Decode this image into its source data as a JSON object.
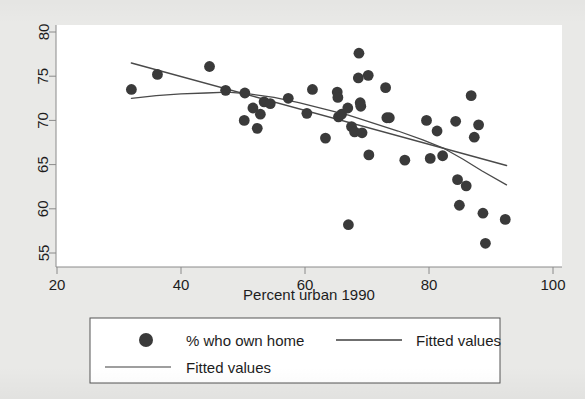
{
  "figure": {
    "background_color": "#e9e9e7",
    "plot_area_color": "#ffffff",
    "frame_color": "#8a8a8a",
    "marker_color": "#3a3a3a",
    "line_color": "#4a4a4a",
    "text_color": "#1d1d1d"
  },
  "axis": {
    "x_title": "Percent urban 1990",
    "x_ticks": [
      "20",
      "40",
      "60",
      "80",
      "100"
    ],
    "y_ticks": [
      "55",
      "60",
      "65",
      "70",
      "75",
      "80"
    ]
  },
  "legend": {
    "entries": [
      {
        "label": "% who own home",
        "marker": "dot"
      },
      {
        "label": "Fitted values",
        "marker": "line"
      },
      {
        "label": "Fitted values",
        "marker": "line"
      }
    ]
  },
  "chart_data": {
    "type": "scatter",
    "title": "",
    "subtitle": "",
    "xlabel": "Percent urban 1990",
    "ylabel": "",
    "xlim": [
      20,
      100
    ],
    "ylim": [
      54.0,
      80.8
    ],
    "xticks": [
      20,
      40,
      60,
      80,
      100
    ],
    "yticks": [
      55,
      60,
      65,
      70,
      75,
      80
    ],
    "grid": false,
    "legend_position": "below-plot",
    "series": [
      {
        "name": "% who own home",
        "type": "scatter",
        "marker": "filled-circle",
        "color": "#3a3a3a",
        "points": [
          [
            32.0,
            73.5
          ],
          [
            36.2,
            75.2
          ],
          [
            44.6,
            76.1
          ],
          [
            47.2,
            73.4
          ],
          [
            50.3,
            73.1
          ],
          [
            50.2,
            70.0
          ],
          [
            51.6,
            71.4
          ],
          [
            52.3,
            69.1
          ],
          [
            52.8,
            70.7
          ],
          [
            53.4,
            72.1
          ],
          [
            54.4,
            71.9
          ],
          [
            57.3,
            72.5
          ],
          [
            60.3,
            70.8
          ],
          [
            61.2,
            73.5
          ],
          [
            63.3,
            68.0
          ],
          [
            65.2,
            73.2
          ],
          [
            65.3,
            72.6
          ],
          [
            65.4,
            70.4
          ],
          [
            65.9,
            70.7
          ],
          [
            66.9,
            71.4
          ],
          [
            67.0,
            58.2
          ],
          [
            67.5,
            69.3
          ],
          [
            68.0,
            68.7
          ],
          [
            68.6,
            74.8
          ],
          [
            68.7,
            77.6
          ],
          [
            68.9,
            72.0
          ],
          [
            69.0,
            71.6
          ],
          [
            69.2,
            68.6
          ],
          [
            70.2,
            75.1
          ],
          [
            70.3,
            66.1
          ],
          [
            73.0,
            73.7
          ],
          [
            73.2,
            70.3
          ],
          [
            73.6,
            70.3
          ],
          [
            76.1,
            65.5
          ],
          [
            79.6,
            70.0
          ],
          [
            80.2,
            65.7
          ],
          [
            81.3,
            68.8
          ],
          [
            82.2,
            66.0
          ],
          [
            84.3,
            69.9
          ],
          [
            84.6,
            63.3
          ],
          [
            84.9,
            60.4
          ],
          [
            86.0,
            62.6
          ],
          [
            86.8,
            72.8
          ],
          [
            87.3,
            68.1
          ],
          [
            88.0,
            69.5
          ],
          [
            88.7,
            59.5
          ],
          [
            89.1,
            56.1
          ],
          [
            92.3,
            58.8
          ]
        ]
      },
      {
        "name": "Fitted values",
        "type": "line",
        "fit": "linear",
        "color": "#4a4a4a",
        "points": [
          [
            32.0,
            76.5
          ],
          [
            92.5,
            64.9
          ]
        ]
      },
      {
        "name": "Fitted values",
        "type": "line",
        "fit": "lowess",
        "color": "#4a4a4a",
        "points": [
          [
            32.0,
            72.5
          ],
          [
            36.0,
            72.8
          ],
          [
            40.0,
            73.0
          ],
          [
            44.0,
            73.1
          ],
          [
            47.5,
            73.2
          ],
          [
            51.0,
            73.0
          ],
          [
            55.0,
            72.6
          ],
          [
            59.0,
            72.0
          ],
          [
            63.0,
            71.3
          ],
          [
            67.0,
            70.6
          ],
          [
            71.0,
            69.7
          ],
          [
            75.0,
            68.8
          ],
          [
            79.0,
            67.8
          ],
          [
            82.5,
            66.8
          ],
          [
            85.5,
            65.6
          ],
          [
            88.5,
            64.3
          ],
          [
            92.5,
            62.7
          ]
        ]
      }
    ]
  }
}
